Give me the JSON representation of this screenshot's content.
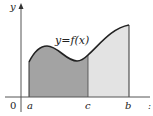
{
  "diagram": {
    "type": "definite-integral-area-split",
    "curve_label": "y=f(x)",
    "axis_labels": {
      "y": "y",
      "origin": "0",
      "x_hint": ":"
    },
    "points": {
      "a": "a",
      "c": "c",
      "b": "b"
    },
    "colors": {
      "region_a_to_c": "#a3a3a3",
      "region_c_to_b": "#e3e3e3",
      "curve": "#222222",
      "axis": "#555555"
    }
  }
}
